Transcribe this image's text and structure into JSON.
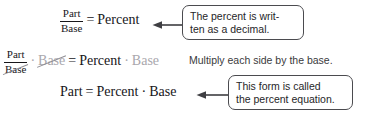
{
  "figure": {
    "ink_color": "#17161a",
    "ghost_color": "#a9a7ad",
    "callout_border_color": "#4b4b4f",
    "background": "#ffffff"
  },
  "equations": {
    "row1": {
      "fraction": {
        "numerator": "Part",
        "denominator": "Base"
      },
      "equals": "=",
      "right": "Percent"
    },
    "row2": {
      "fraction": {
        "numerator": "Part",
        "denominator": "Base"
      },
      "dot1": "·",
      "cancelled_base": "Base",
      "equals": "=",
      "right": "Percent",
      "dot2": "·",
      "trailing_base": "Base"
    },
    "row3": {
      "left": "Part",
      "equals": "=",
      "right": "Percent",
      "dot": "·",
      "base": "Base"
    }
  },
  "notes": {
    "multiply": "Multiply each side by the base."
  },
  "callouts": [
    {
      "id": "percent-decimal",
      "line1": "The percent is writ-",
      "line2": "ten as a decimal.",
      "arrow": "arrow-left-icon"
    },
    {
      "id": "percent-equation",
      "line1": "This form is called",
      "line2": "the percent equation.",
      "arrow": "arrow-left-icon"
    }
  ]
}
